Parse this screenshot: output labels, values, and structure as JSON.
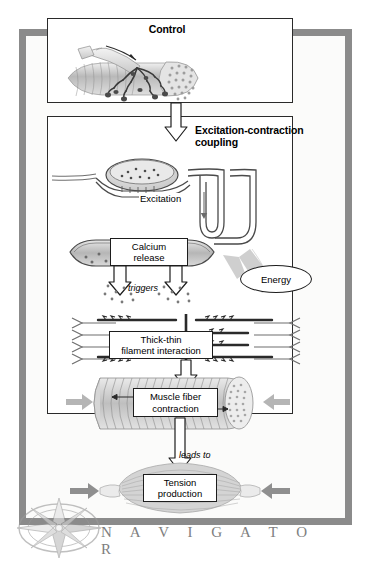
{
  "figure": {
    "kind": "flowchart-navigator",
    "footer_label": "N A V I G A T O R",
    "compass_icon": "compass-rose-icon"
  },
  "colors": {
    "frame_border": "#8b8b8b",
    "page_background": "#ffffff",
    "panel_background": "#ffffff",
    "panel_border": "#2a2a2a",
    "box_border": "#1d1d1d",
    "arrow_outline": "#1d1d1d",
    "arrow_fill": "#ffffff",
    "gray_arrow": "#bdbdbd",
    "tissue_gray": "#c9c9c9",
    "navigator_text": "#7e7e7e"
  },
  "panels": [
    {
      "id": "control",
      "title": "Control",
      "illustration": "motor-neuron-neuromuscular-junction-illustration"
    },
    {
      "id": "excitation-contraction-coupling",
      "title": "Excitation-contraction coupling",
      "title_line_1": "Excitation-contraction",
      "title_line_2": "coupling",
      "illustrations": [
        "synaptic-terminal-t-tubule-illustration",
        "sarcoplasmic-reticulum-illustration",
        "thick-thin-filament-sarcomere-illustration",
        "muscle-fiber-cylinder-illustration"
      ]
    }
  ],
  "nodes": [
    {
      "id": "calcium-release",
      "line_1": "Calcium",
      "line_2": "release"
    },
    {
      "id": "energy",
      "label": "Energy"
    },
    {
      "id": "thick-thin-filament-interaction",
      "line_1": "Thick-thin",
      "line_2": "filament interaction"
    },
    {
      "id": "muscle-fiber-contraction",
      "line_1": "Muscle fiber",
      "line_2": "contraction"
    },
    {
      "id": "tension-production",
      "line_1": "Tension",
      "line_2": "production"
    }
  ],
  "edge_labels": [
    {
      "id": "excitation",
      "text": "Excitation"
    },
    {
      "id": "triggers",
      "text": "triggers"
    },
    {
      "id": "leads-to",
      "text": "leads to"
    }
  ],
  "arrows": [
    {
      "id": "control-to-ecc",
      "style": "hollow-block",
      "direction": "down"
    },
    {
      "id": "excitation-down-t-tubule",
      "style": "thin-line",
      "direction": "down"
    },
    {
      "id": "triggers-left",
      "style": "hollow-block",
      "direction": "down"
    },
    {
      "id": "triggers-right",
      "style": "hollow-block",
      "direction": "down"
    },
    {
      "id": "energy-to-filaments",
      "style": "solid-gray-block",
      "direction": "down-left"
    },
    {
      "id": "filament-to-muscle-fiber",
      "style": "hollow-block",
      "direction": "down"
    },
    {
      "id": "muscle-fiber-to-tension",
      "style": "hollow-block",
      "direction": "down"
    },
    {
      "id": "contraction-pull-left",
      "style": "solid-gray",
      "direction": "right"
    },
    {
      "id": "contraction-pull-right",
      "style": "solid-gray",
      "direction": "left"
    },
    {
      "id": "tension-pull-left",
      "style": "solid-gray",
      "direction": "right"
    },
    {
      "id": "tension-pull-right",
      "style": "solid-gray",
      "direction": "left"
    }
  ]
}
